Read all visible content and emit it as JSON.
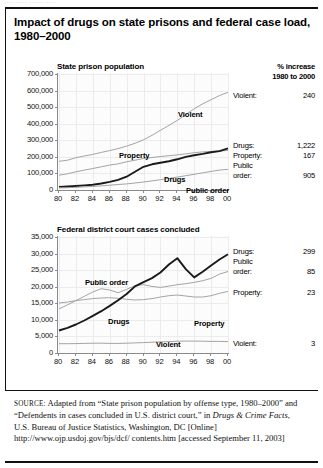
{
  "figure": {
    "title": "Impact of drugs on state prisons and federal case load, 1980–2000",
    "ghost_text": "••••  •••••  ••••••  ••••"
  },
  "source": {
    "label": "SOURCE:",
    "text_1": " Adapted from “State prison population by offense type, 1980–2000” and “Defendents in cases concluded in U.S. district court,” in ",
    "italic": "Drugs & Crime Facts",
    "text_2": ", U.S. Bureau of Justice Statistics, Washington, DC [Online] http://www.ojp.usdoj.gov/bjs/dcf/ contents.htm [accessed September 11, 2003]"
  },
  "panel1": {
    "header_line1": "% increase",
    "header_line2": "1980 to 2000",
    "rows": [
      {
        "name": "Violent:",
        "value": "240"
      },
      {
        "name": "Drugs:",
        "value": "1,222"
      },
      {
        "name": "Property:",
        "value": "167"
      },
      {
        "name": "Public",
        "name2": "order:",
        "value": "905"
      }
    ]
  },
  "panel2": {
    "rows": [
      {
        "name": "Drugs:",
        "value": "299"
      },
      {
        "name": "Public",
        "name2": "order:",
        "value": "85"
      },
      {
        "name": "Property:",
        "value": "23"
      },
      {
        "name": "Violent:",
        "value": "3"
      }
    ]
  },
  "chart_data": [
    {
      "type": "line",
      "title": "State prison population",
      "xlabel": "",
      "ylabel": "",
      "x": [
        "80",
        "81",
        "82",
        "83",
        "84",
        "85",
        "86",
        "87",
        "88",
        "89",
        "90",
        "91",
        "92",
        "93",
        "94",
        "95",
        "96",
        "97",
        "98",
        "99",
        "00"
      ],
      "xticks": [
        "80",
        "82",
        "84",
        "86",
        "88",
        "90",
        "92",
        "94",
        "96",
        "98",
        "00"
      ],
      "yticks": [
        "0",
        "100,000",
        "200,000",
        "300,000",
        "400,000",
        "500,000",
        "600,000",
        "700,000"
      ],
      "ylim": [
        0,
        700000
      ],
      "grid": true,
      "series": [
        {
          "name": "Violent",
          "style": "thin",
          "values": [
            173300,
            180000,
            195000,
            205000,
            215000,
            227000,
            238000,
            250000,
            265000,
            282000,
            303000,
            330000,
            360000,
            390000,
            420000,
            455000,
            490000,
            520000,
            545000,
            570000,
            589100
          ]
        },
        {
          "name": "Property",
          "style": "thin",
          "values": [
            89300,
            98000,
            110000,
            120000,
            130000,
            140000,
            150000,
            158000,
            170000,
            180000,
            190000,
            196000,
            202000,
            207000,
            212000,
            218000,
            225000,
            230000,
            233000,
            236000,
            238500
          ]
        },
        {
          "name": "Drugs",
          "style": "thick",
          "values": [
            19000,
            21000,
            24000,
            28000,
            32000,
            39000,
            49000,
            61000,
            80000,
            110000,
            140000,
            155000,
            165000,
            174000,
            185000,
            200000,
            210000,
            218000,
            228000,
            235000,
            251100
          ]
        },
        {
          "name": "Public order",
          "style": "thin",
          "values": [
            12400,
            14000,
            16000,
            19000,
            22000,
            25000,
            29000,
            33000,
            37000,
            42000,
            48000,
            55000,
            62000,
            70000,
            78000,
            86000,
            95000,
            104000,
            112000,
            120000,
            124900
          ]
        }
      ]
    },
    {
      "type": "line",
      "title": "Federal district court cases concluded",
      "xlabel": "",
      "ylabel": "",
      "x": [
        "80",
        "81",
        "82",
        "83",
        "84",
        "85",
        "86",
        "87",
        "88",
        "89",
        "90",
        "91",
        "92",
        "93",
        "94",
        "95",
        "96",
        "97",
        "98",
        "99",
        "00"
      ],
      "xticks": [
        "80",
        "82",
        "84",
        "86",
        "88",
        "90",
        "92",
        "94",
        "96",
        "98",
        "00"
      ],
      "yticks": [
        "0",
        "5,000",
        "10,000",
        "15,000",
        "20,000",
        "25,000",
        "30,000",
        "35,000"
      ],
      "ylim": [
        0,
        35000
      ],
      "grid": true,
      "series": [
        {
          "name": "Public order",
          "style": "thin",
          "values": [
            13300,
            14500,
            15800,
            17100,
            18400,
            19400,
            19000,
            18200,
            19200,
            20300,
            20600,
            20100,
            19800,
            20200,
            20600,
            20900,
            21300,
            21800,
            22500,
            23800,
            24600
          ]
        },
        {
          "name": "Property",
          "style": "thin",
          "values": [
            15100,
            15400,
            15800,
            16100,
            16400,
            16600,
            16700,
            16500,
            16200,
            16000,
            16100,
            16400,
            16900,
            17300,
            17500,
            17200,
            16900,
            16900,
            17300,
            18000,
            18600
          ]
        },
        {
          "name": "Drugs",
          "style": "thick",
          "values": [
            6800,
            7600,
            8600,
            9800,
            11200,
            12600,
            14200,
            15900,
            17800,
            20100,
            21400,
            22600,
            24300,
            26700,
            28600,
            25300,
            22800,
            24500,
            26400,
            28200,
            29800
          ]
        },
        {
          "name": "Violent",
          "style": "thin",
          "values": [
            2800,
            2800,
            2850,
            2900,
            2950,
            2950,
            2900,
            2900,
            2950,
            3050,
            3150,
            3250,
            3350,
            3450,
            3550,
            3600,
            3600,
            3550,
            3500,
            3500,
            3450
          ]
        }
      ]
    }
  ]
}
